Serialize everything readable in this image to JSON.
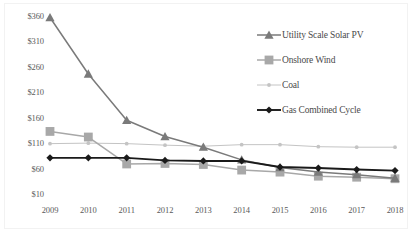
{
  "chart_data": {
    "type": "line",
    "title": "",
    "subtitle": "",
    "xlabel": "",
    "ylabel": "",
    "categories": [
      "2009",
      "2010",
      "2011",
      "2012",
      "2013",
      "2014",
      "2015",
      "2016",
      "2017",
      "2018"
    ],
    "x": [
      2009,
      2010,
      2011,
      2012,
      2013,
      2014,
      2015,
      2016,
      2017,
      2018
    ],
    "ylim": [
      10,
      360
    ],
    "yticks": [
      10,
      60,
      110,
      160,
      210,
      260,
      310,
      360
    ],
    "ytick_labels": [
      "$10",
      "$60",
      "$110",
      "$160",
      "$210",
      "$260",
      "$310",
      "$360"
    ],
    "xtick_labels": [
      "2009",
      "2010",
      "2011",
      "2012",
      "2013",
      "2014",
      "2015",
      "2016",
      "2017",
      "2018"
    ],
    "grid": false,
    "legend_position": "top-right",
    "series": [
      {
        "name": "Utility Scale Solar PV",
        "color": "#7a7a7a",
        "marker": "triangle",
        "values": [
          359,
          248,
          157,
          125,
          104,
          79,
          64,
          55,
          50,
          43
        ]
      },
      {
        "name": "Onshore Wind",
        "color": "#a8a8a8",
        "marker": "square",
        "values": [
          135,
          124,
          71,
          72,
          70,
          59,
          55,
          47,
          45,
          42
        ]
      },
      {
        "name": "Coal",
        "color": "#c4c4c4",
        "marker": "circle",
        "values": [
          111,
          112,
          111,
          108,
          106,
          109,
          109,
          105,
          104,
          104
        ]
      },
      {
        "name": "Gas Combined Cycle",
        "color": "#1a1a1a",
        "marker": "diamond",
        "values": [
          83,
          83,
          83,
          78,
          77,
          77,
          65,
          63,
          60,
          58
        ]
      }
    ]
  },
  "legend": {
    "items": [
      {
        "label": "Utility Scale Solar PV",
        "icon": "triangle-marker-icon"
      },
      {
        "label": "Onshore Wind",
        "icon": "square-marker-icon"
      },
      {
        "label": "Coal",
        "icon": "circle-marker-icon"
      },
      {
        "label": "Gas Combined Cycle",
        "icon": "diamond-marker-icon"
      }
    ]
  }
}
